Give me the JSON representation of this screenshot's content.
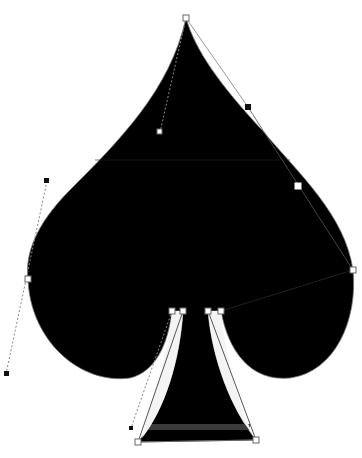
{
  "canvas": {
    "width": 362,
    "height": 458,
    "background": "#ffffff",
    "shape_fill": "#000000",
    "outline_color": "#888888",
    "handle_line_color": "#999999"
  },
  "shape": {
    "name": "spade",
    "description": "Black spade suit shape with Bezier path editing handles"
  },
  "anchors": [
    {
      "id": "top",
      "x": 186,
      "y": 18,
      "style": "hollow"
    },
    {
      "id": "left",
      "x": 28,
      "y": 279,
      "style": "hollow"
    },
    {
      "id": "right",
      "x": 353,
      "y": 270,
      "style": "hollow"
    },
    {
      "id": "stem-left-outer",
      "x": 172,
      "y": 311,
      "style": "hollow"
    },
    {
      "id": "stem-left-inner",
      "x": 183,
      "y": 311,
      "style": "hollow"
    },
    {
      "id": "stem-right-inner",
      "x": 208,
      "y": 311,
      "style": "hollow"
    },
    {
      "id": "stem-right-outer",
      "x": 221,
      "y": 311,
      "style": "hollow"
    },
    {
      "id": "base-left",
      "x": 138,
      "y": 442,
      "style": "hollow"
    },
    {
      "id": "base-right",
      "x": 256,
      "y": 440,
      "style": "hollow"
    }
  ],
  "control_points": [
    {
      "id": "top-handle-in",
      "x": 160,
      "y": 132,
      "style": "hollow",
      "line": "dotted",
      "from": "top"
    },
    {
      "id": "top-handle-out",
      "x": 248,
      "y": 107,
      "style": "filled",
      "line": "solid",
      "from": "top"
    },
    {
      "id": "right-handle-in",
      "x": 298,
      "y": 186,
      "style": "white",
      "line": "solid",
      "from": "right"
    },
    {
      "id": "left-handle-up",
      "x": 47,
      "y": 181,
      "style": "filled",
      "line": "dotted",
      "from": "left"
    },
    {
      "id": "left-handle-down",
      "x": 6,
      "y": 374,
      "style": "filled",
      "line": "dotted",
      "from": "left"
    },
    {
      "id": "base-left-handle",
      "x": 131,
      "y": 428,
      "style": "filled",
      "line": "dotted",
      "from": "stem-left-outer"
    }
  ]
}
